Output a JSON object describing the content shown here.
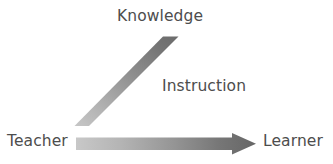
{
  "diagram": {
    "background_color": "#ffffff",
    "text_color": "#4d4d4d",
    "labels": {
      "knowledge": "Knowledge",
      "instruction": "Instruction",
      "teacher": "Teacher",
      "learner": "Learner"
    },
    "arrows": [
      {
        "name": "knowledge-arrow",
        "label": "Knowledge",
        "direction": "diagonal-up-right",
        "from": "Teacher",
        "to": "Knowledge",
        "gradient_start_color": "#bdbdbd",
        "gradient_end_color": "#6b6b6b"
      },
      {
        "name": "instruction-arrow",
        "label": "Instruction",
        "direction": "horizontal-right",
        "from": "Teacher",
        "to": "Learner",
        "gradient_start_color": "#c2c2c2",
        "gradient_end_color": "#666666"
      }
    ]
  }
}
